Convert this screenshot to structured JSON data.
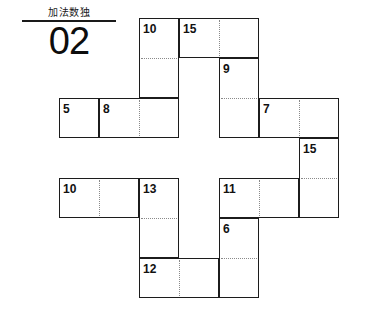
{
  "page": {
    "width": 372,
    "height": 323,
    "background": "#ffffff",
    "ink": "#1c1c1c"
  },
  "title": {
    "japanese": "加法数独",
    "number": "02",
    "rule": "horizontal-rule"
  },
  "puzzle": {
    "type": "killer-sudoku-cages",
    "cell_size": 40,
    "origin": {
      "x": 59,
      "y": 18
    },
    "grid_columns": 7,
    "grid_rows": 7,
    "cages": [
      {
        "id": "cage-10-top",
        "clue": "10",
        "col": 2,
        "row": 0,
        "cols": 1,
        "rows": 2,
        "orientation": "vertical",
        "splits_h": [
          1
        ],
        "splits_v": []
      },
      {
        "id": "cage-15-top",
        "clue": "15",
        "col": 3,
        "row": 0,
        "cols": 2,
        "rows": 1,
        "orientation": "horizontal",
        "splits_h": [],
        "splits_v": [
          1
        ]
      },
      {
        "id": "cage-9",
        "clue": "9",
        "col": 4,
        "row": 1,
        "cols": 1,
        "rows": 2,
        "orientation": "vertical",
        "splits_h": [
          1
        ],
        "splits_v": []
      },
      {
        "id": "cage-5",
        "clue": "5",
        "col": 0,
        "row": 2,
        "cols": 1,
        "rows": 1,
        "orientation": "single",
        "splits_h": [],
        "splits_v": []
      },
      {
        "id": "cage-8",
        "clue": "8",
        "col": 1,
        "row": 2,
        "cols": 2,
        "rows": 1,
        "orientation": "horizontal",
        "splits_h": [],
        "splits_v": [
          1
        ]
      },
      {
        "id": "cage-7",
        "clue": "7",
        "col": 5,
        "row": 2,
        "cols": 2,
        "rows": 1,
        "orientation": "horizontal",
        "splits_h": [],
        "splits_v": [
          1
        ]
      },
      {
        "id": "cage-15-right",
        "clue": "15",
        "col": 6,
        "row": 3,
        "cols": 1,
        "rows": 2,
        "orientation": "vertical",
        "splits_h": [
          1
        ],
        "splits_v": []
      },
      {
        "id": "cage-10-left",
        "clue": "10",
        "col": 0,
        "row": 4,
        "cols": 2,
        "rows": 1,
        "orientation": "horizontal",
        "splits_h": [],
        "splits_v": [
          1
        ]
      },
      {
        "id": "cage-13",
        "clue": "13",
        "col": 2,
        "row": 4,
        "cols": 1,
        "rows": 2,
        "orientation": "vertical",
        "splits_h": [
          1
        ],
        "splits_v": []
      },
      {
        "id": "cage-11",
        "clue": "11",
        "col": 4,
        "row": 4,
        "cols": 2,
        "rows": 1,
        "orientation": "horizontal",
        "splits_h": [],
        "splits_v": [
          1
        ]
      },
      {
        "id": "cage-6",
        "clue": "6",
        "col": 4,
        "row": 5,
        "cols": 1,
        "rows": 2,
        "orientation": "vertical",
        "splits_h": [
          1
        ],
        "splits_v": []
      },
      {
        "id": "cage-12",
        "clue": "12",
        "col": 2,
        "row": 6,
        "cols": 2,
        "rows": 1,
        "orientation": "horizontal",
        "splits_h": [],
        "splits_v": [
          1
        ]
      }
    ]
  }
}
